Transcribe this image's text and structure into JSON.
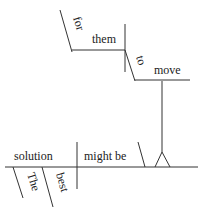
{
  "diagram": {
    "type": "sentence-diagram",
    "sentence": "The best solution for them to move might be",
    "words": {
      "subject": "solution",
      "verb": "might be",
      "article": "The",
      "adjective": "best",
      "preposition": "for",
      "object": "them",
      "infinitive_marker": "to",
      "infinitive_verb": "move"
    }
  }
}
